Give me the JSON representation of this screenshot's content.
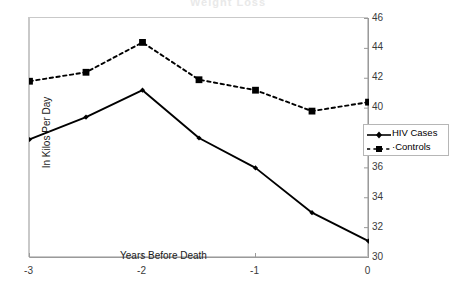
{
  "title_ghost": "Weight Loss",
  "legend": {
    "items": [
      {
        "label": "HIV Cases",
        "marker": "diamond-marker-icon",
        "style": "solid"
      },
      {
        "label": "·Controls",
        "marker": "square-marker-icon",
        "style": "dashed"
      }
    ]
  },
  "axes": {
    "ylabel": "In Kilos Per Day",
    "xlabel_inner": "Years Before Death",
    "ytick_labels": [
      "30",
      "32",
      "34",
      "36",
      "38",
      "40",
      "42",
      "44",
      "46"
    ],
    "xtick_labels": [
      "-3",
      "-2",
      "-1",
      "0"
    ]
  },
  "chart_data": {
    "type": "line",
    "title": "Weight Loss",
    "xlabel": "Years Before Death",
    "ylabel": "In Kilos Per Day",
    "x": [
      -3,
      -2.5,
      -2,
      -1.5,
      -1,
      -0.5,
      0
    ],
    "xlim": [
      -3,
      0
    ],
    "ylim": [
      30,
      46
    ],
    "yticks": [
      30,
      32,
      34,
      36,
      38,
      40,
      42,
      44,
      46
    ],
    "xticks": [
      -3,
      -2,
      -1,
      0
    ],
    "y_axis_side": "right",
    "grid": false,
    "legend_position": "right",
    "series": [
      {
        "name": "HIV Cases",
        "values": [
          37.9,
          39.4,
          41.2,
          38.0,
          36.0,
          33.0,
          31.1
        ],
        "line_style": "solid",
        "marker": "diamond",
        "color": "#000000"
      },
      {
        "name": "Controls",
        "values": [
          41.8,
          42.4,
          44.4,
          41.9,
          41.2,
          39.8,
          40.4
        ],
        "line_style": "dashed",
        "marker": "square",
        "color": "#000000"
      }
    ]
  }
}
